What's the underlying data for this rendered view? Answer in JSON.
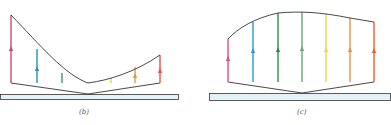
{
  "panels": [
    {
      "id": "b",
      "label": "(b)",
      "label_pos": [
        83,
        117
      ],
      "slab": {
        "x": 0,
        "y": 94,
        "w": 179,
        "h": 6,
        "fill": "#e4f1f6",
        "stroke": "#333333"
      },
      "apex": [
        88,
        94
      ],
      "bottom_y": 83,
      "profile_path": "M11,15 C40,45 65,75 88,83 C110,80 135,72 160,55",
      "vectors": [
        {
          "x": 11,
          "top": 15,
          "color": "#c74a78",
          "arrow_y": 50
        },
        {
          "x": 37,
          "top": 49,
          "color": "#2a8fc4",
          "arrow_y": 70
        },
        {
          "x": 62,
          "top": 73,
          "color": "#3f9a5a",
          "arrow_y": null
        },
        {
          "x": 111,
          "top": 78,
          "color": "#e8d84a",
          "arrow_y": null
        },
        {
          "x": 135,
          "top": 67,
          "color": "#e39a45",
          "arrow_y": 77
        },
        {
          "x": 160,
          "top": 55,
          "color": "#dc5a3a",
          "arrow_y": 72
        }
      ]
    },
    {
      "id": "c",
      "label": "(c)",
      "label_pos": [
        301,
        117
      ],
      "slab": {
        "x": 209,
        "y": 93,
        "w": 182,
        "h": 8,
        "fill": "#e4f1f6",
        "stroke": "#333333"
      },
      "apex": [
        302,
        93
      ],
      "bottom_y": 82,
      "profile_path": "M228,39 C238,28 255,18 278,13 C300,11 320,12 350,18 L374,22",
      "vectors": [
        {
          "x": 228,
          "top": 39,
          "color": "#d9508a",
          "arrow_y": 60
        },
        {
          "x": 253,
          "top": 22,
          "color": "#2a9bd0",
          "arrow_y": 52
        },
        {
          "x": 278,
          "top": 13,
          "color": "#2f8a48",
          "arrow_y": 51
        },
        {
          "x": 302,
          "top": 12,
          "color": "#6aa57c",
          "arrow_y": 50
        },
        {
          "x": 326,
          "top": 14,
          "color": "#f0d64a",
          "arrow_y": 51
        },
        {
          "x": 350,
          "top": 18,
          "color": "#e4944a",
          "arrow_y": 51
        },
        {
          "x": 374,
          "top": 22,
          "color": "#e5602e",
          "arrow_y": 52
        }
      ]
    }
  ],
  "colors": {
    "outline": "#333333",
    "label": "#555555"
  }
}
